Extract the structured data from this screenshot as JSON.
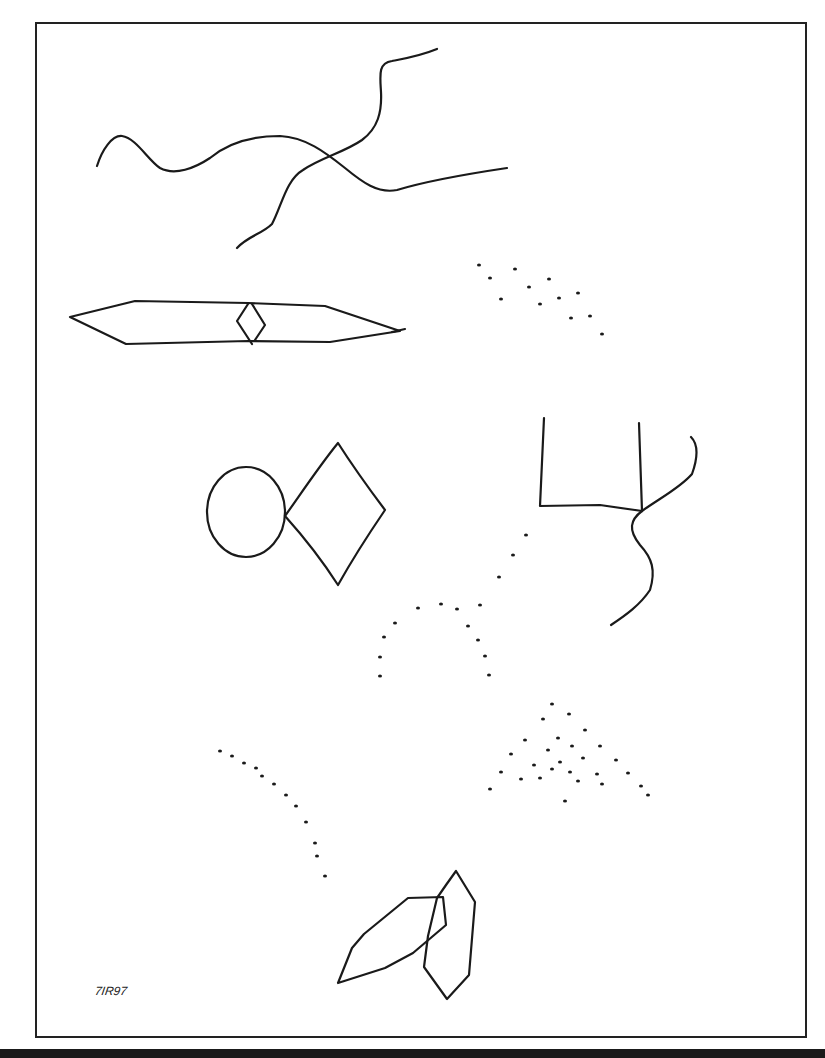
{
  "artwork": {
    "signature": "7IR97",
    "stroke_color": "#1a1a1a",
    "background": "#ffffff",
    "elements": {
      "wave_line": "M97,166 C102,150 112,135 122,136 C136,138 148,160 160,168 C175,176 195,168 210,158 C228,143 252,136 280,136 C305,137 325,152 345,168 C362,182 378,194 397,190 C420,183 460,175 507,168",
      "crossing_line": "M237,248 C248,236 262,234 272,224 C282,205 286,180 303,170 C320,158 345,152 362,140 C378,128 382,112 381,92 C380,75 378,63 392,61 C408,58 420,56 437,49",
      "lens_shape": "M70,317 L135,301 L248,303 L325,306 L400,331 L330,342 L248,341 L126,344 Z",
      "lens_tail": "M392,332 L405,329",
      "small_diamond": "M248,304 L237,321 L252,344 M252,304 L265,325 L255,340",
      "circle": {
        "cx": 246,
        "cy": 512,
        "rx": 39,
        "ry": 45
      },
      "large_diamond": "M285,516 C300,495 320,465 338,443 C352,465 370,490 385,510 C368,535 352,560 338,585 C322,560 302,535 285,516 Z",
      "bracket_shape": "M544,418 L540,506 L600,505 L642,511 L639,423",
      "branch_up": "M642,511 C660,498 680,488 692,474 C697,460 699,445 691,437",
      "branch_down": "M642,511 C630,520 628,530 640,545 C652,558 656,570 650,590 C640,605 626,615 611,625",
      "left_leaf": "M338,983 L352,948 L364,934 L408,898 L443,897 L446,925 L413,953 L385,968 Z",
      "right_leaf": "M456,871 L475,902 L469,975 L447,999 L424,967 L428,936 L437,898 L446,885 Z"
    },
    "dot_clusters": {
      "upper_right_dots": [
        [
          479,
          265
        ],
        [
          490,
          278
        ],
        [
          501,
          299
        ],
        [
          515,
          269
        ],
        [
          529,
          287
        ],
        [
          540,
          304
        ],
        [
          549,
          279
        ],
        [
          559,
          298
        ],
        [
          578,
          293
        ],
        [
          571,
          318
        ],
        [
          590,
          316
        ],
        [
          602,
          334
        ]
      ],
      "arch_dots": [
        [
          526,
          535
        ],
        [
          513,
          555
        ],
        [
          499,
          577
        ],
        [
          480,
          605
        ],
        [
          457,
          609
        ],
        [
          441,
          604
        ],
        [
          418,
          608
        ],
        [
          395,
          623
        ],
        [
          384,
          637
        ],
        [
          380,
          657
        ],
        [
          380,
          676
        ],
        [
          468,
          626
        ],
        [
          478,
          640
        ],
        [
          485,
          656
        ],
        [
          489,
          675
        ]
      ],
      "triangle_dots": [
        [
          552,
          704
        ],
        [
          569,
          714
        ],
        [
          543,
          719
        ],
        [
          585,
          730
        ],
        [
          525,
          740
        ],
        [
          558,
          738
        ],
        [
          511,
          754
        ],
        [
          548,
          750
        ],
        [
          572,
          746
        ],
        [
          600,
          746
        ],
        [
          534,
          765
        ],
        [
          560,
          762
        ],
        [
          583,
          758
        ],
        [
          616,
          760
        ],
        [
          501,
          772
        ],
        [
          521,
          779
        ],
        [
          552,
          769
        ],
        [
          570,
          772
        ],
        [
          597,
          774
        ],
        [
          628,
          773
        ],
        [
          540,
          778
        ],
        [
          578,
          781
        ],
        [
          602,
          784
        ],
        [
          490,
          789
        ],
        [
          641,
          786
        ],
        [
          648,
          795
        ],
        [
          565,
          801
        ]
      ],
      "curve_dots": [
        [
          220,
          751
        ],
        [
          232,
          756
        ],
        [
          244,
          763
        ],
        [
          256,
          768
        ],
        [
          262,
          776
        ],
        [
          274,
          784
        ],
        [
          286,
          795
        ],
        [
          296,
          806
        ],
        [
          306,
          822
        ],
        [
          315,
          843
        ],
        [
          317,
          856
        ],
        [
          325,
          876
        ]
      ]
    }
  }
}
